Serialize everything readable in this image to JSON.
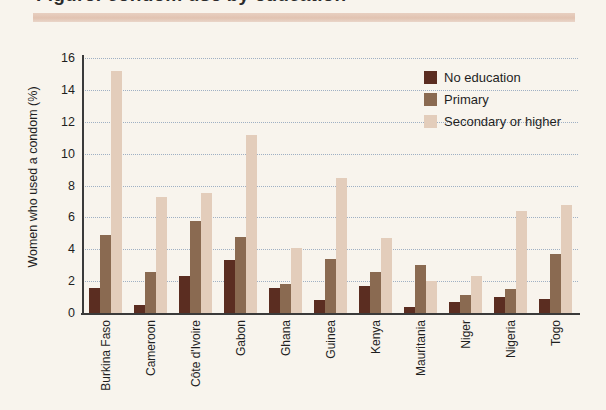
{
  "header": {
    "title_partial": "Figure: condom use by education",
    "rule_color": "#e0c0ae"
  },
  "legend": {
    "position": "top-right",
    "items": [
      {
        "label": "No education",
        "color": "#5b2d21"
      },
      {
        "label": "Primary",
        "color": "#8a6a51"
      },
      {
        "label": "Secondary or higher",
        "color": "#e3cdbb"
      }
    ]
  },
  "chart_data": {
    "type": "bar",
    "title": "",
    "xlabel": "",
    "ylabel": "Women who used a condom (%)",
    "ylim": [
      0,
      16
    ],
    "yticks": [
      0,
      2,
      4,
      6,
      8,
      10,
      12,
      14,
      16
    ],
    "grid": true,
    "grid_style": "dotted",
    "legend_position": "top-right",
    "categories": [
      "Burkina Faso",
      "Cameroon",
      "Côte d'Ivoire",
      "Gabon",
      "Ghana",
      "Guinea",
      "Kenya",
      "Mauritania",
      "Niger",
      "Nigeria",
      "Togo"
    ],
    "series": [
      {
        "name": "No education",
        "color": "#5b2d21",
        "values": [
          1.6,
          0.5,
          2.3,
          3.3,
          1.6,
          0.8,
          1.7,
          0.4,
          0.7,
          1.0,
          0.9
        ]
      },
      {
        "name": "Primary",
        "color": "#8a6a51",
        "values": [
          4.9,
          2.6,
          5.8,
          4.8,
          1.8,
          3.4,
          2.6,
          3.0,
          1.1,
          1.5,
          3.7
        ]
      },
      {
        "name": "Secondary or higher",
        "color": "#e3cdbb",
        "values": [
          15.2,
          7.3,
          7.5,
          11.2,
          4.1,
          8.5,
          4.7,
          2.0,
          2.3,
          6.4,
          6.8
        ]
      }
    ]
  },
  "colors": {
    "background": "#f8f4ed",
    "axis": "#3a3a3a",
    "grid": "#9fb0c4",
    "text": "#1f1f1f"
  }
}
